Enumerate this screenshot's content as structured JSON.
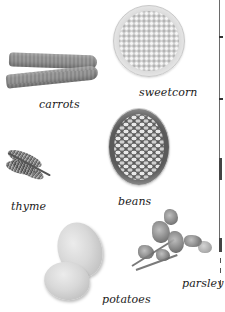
{
  "page": {
    "type": "picture-book-page",
    "background": "#ffffff",
    "label_color": "#1a1a1a"
  },
  "items": [
    {
      "id": "carrots",
      "label": "carrots",
      "icon": "carrots-illustration"
    },
    {
      "id": "sweetcorn",
      "label": "sweetcorn",
      "icon": "sweetcorn-bowl-illustration"
    },
    {
      "id": "thyme",
      "label": "thyme",
      "icon": "thyme-sprig-illustration"
    },
    {
      "id": "beans",
      "label": "beans",
      "icon": "beans-bowl-illustration"
    },
    {
      "id": "potatoes",
      "label": "potatoes",
      "icon": "potatoes-illustration"
    },
    {
      "id": "parsley",
      "label": "parsley",
      "icon": "parsley-sprig-illustration"
    }
  ]
}
